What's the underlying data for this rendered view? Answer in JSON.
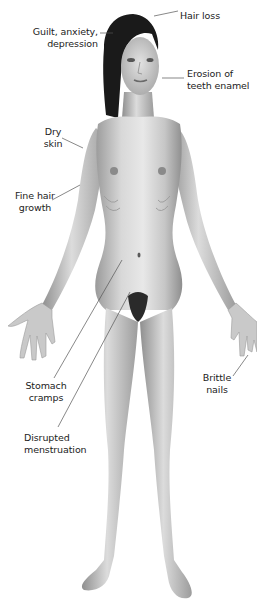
{
  "diagram": {
    "palette": {
      "background": "#ffffff",
      "skin_light": "#e6e6e6",
      "skin_mid": "#bdbdbd",
      "skin_dark": "#8a8a8a",
      "hair": "#1a1a1a",
      "leader_line": "#555555",
      "text": "#222222"
    }
  },
  "labels": [
    {
      "id": "hair-loss",
      "lines": [
        "Hair loss"
      ]
    },
    {
      "id": "guilt-anxiety-depression",
      "lines": [
        "Guilt, anxiety,",
        "depression"
      ]
    },
    {
      "id": "erosion-of-teeth-enamel",
      "lines": [
        "Erosion of",
        "teeth enamel"
      ]
    },
    {
      "id": "dry-skin",
      "lines": [
        "Dry",
        "skin"
      ]
    },
    {
      "id": "fine-hair-growth",
      "lines": [
        "Fine hair",
        "growth"
      ]
    },
    {
      "id": "stomach-cramps",
      "lines": [
        "Stomach",
        "cramps"
      ]
    },
    {
      "id": "brittle-nails",
      "lines": [
        "Brittle",
        "nails"
      ]
    },
    {
      "id": "disrupted-menstruation",
      "lines": [
        "Disrupted",
        "menstruation"
      ]
    }
  ]
}
